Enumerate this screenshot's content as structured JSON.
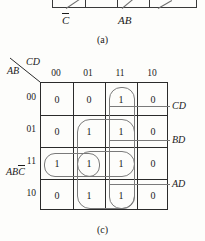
{
  "figure_a": {
    "caption": "(a)",
    "labels": {
      "c_bar": "C",
      "ab": "AB"
    },
    "note": "cropped bottom fragment of preceding Karnaugh map"
  },
  "figure_c": {
    "caption": "(c)",
    "axis": {
      "row_var": "AB",
      "col_var": "CD"
    },
    "col_headers": [
      "00",
      "01",
      "11",
      "10"
    ],
    "row_headers": [
      "00",
      "01",
      "11",
      "10"
    ],
    "left_label": "ABC",
    "cells": [
      [
        "0",
        "0",
        "1",
        "0"
      ],
      [
        "0",
        "1",
        "1",
        "0"
      ],
      [
        "1",
        "1",
        "1",
        "0"
      ],
      [
        "0",
        "1",
        "1",
        "0"
      ]
    ],
    "group_labels": {
      "cd": "CD",
      "bd": "BD",
      "ad": "AD"
    }
  },
  "chart_data": {
    "type": "table",
    "xlabel": "CD",
    "ylabel": "AB",
    "categories": [
      "00",
      "01",
      "11",
      "10"
    ],
    "rows": [
      "00",
      "01",
      "11",
      "10"
    ],
    "values": [
      [
        0,
        0,
        1,
        0
      ],
      [
        0,
        1,
        1,
        0
      ],
      [
        1,
        1,
        1,
        0
      ],
      [
        0,
        1,
        1,
        0
      ]
    ],
    "annotations": [
      "CD",
      "BD",
      "AD",
      "ABC"
    ],
    "grid": true,
    "legend": "none"
  }
}
